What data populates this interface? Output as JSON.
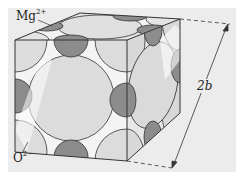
{
  "figure": {
    "labels": {
      "cation": {
        "base": "Mg",
        "charge": "2+"
      },
      "anion": {
        "base": "O",
        "charge": "2−"
      },
      "dimension": "2b"
    },
    "colors": {
      "panel": "#ececec",
      "anion_sphere": "#dcdcdc",
      "anion_highlight": "#f6f6f6",
      "cation_sphere": "#8c8c8c",
      "edge": "#333333"
    }
  }
}
